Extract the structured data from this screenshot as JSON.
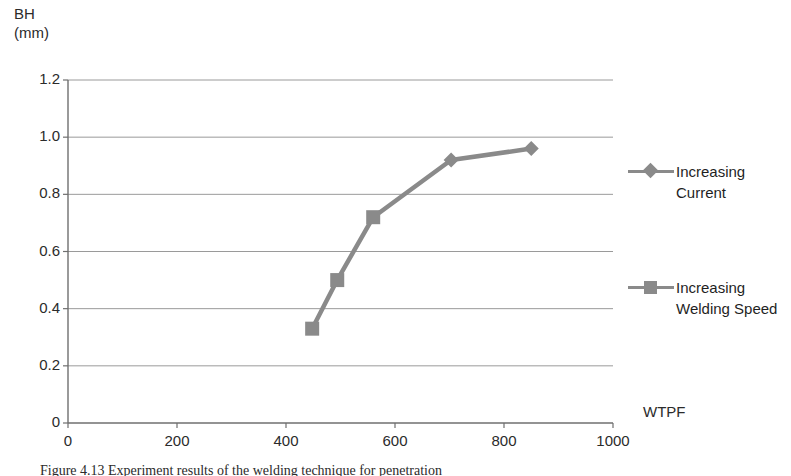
{
  "figure": {
    "caption": "Figure 4.13 Experiment results of the welding technique for penetration",
    "background": "#ffffff",
    "series_color": "#8a8a8a",
    "grid_color": "#9a9a9a",
    "axis_color": "#6f6f6f"
  },
  "chart_data": {
    "type": "line",
    "title": "",
    "subtitle": "",
    "xlabel": "WTPF",
    "ylabel": "BH (mm)",
    "ylabel_lines": [
      "BH",
      "(mm)"
    ],
    "xlim": [
      0,
      1000
    ],
    "ylim": [
      0,
      1.2
    ],
    "xticks": [
      0,
      200,
      400,
      600,
      800,
      1000
    ],
    "xtick_labels": [
      "0",
      "200",
      "400",
      "600",
      "800",
      "1000"
    ],
    "yticks": [
      0,
      0.2,
      0.4,
      0.6,
      0.8,
      1.0,
      1.2
    ],
    "ytick_labels": [
      "0",
      "0.2",
      "0.4",
      "0.6",
      "0.8",
      "1.0",
      "1.2"
    ],
    "grid": "horizontal",
    "legend_position": "right",
    "series": [
      {
        "name": "Increasing Welding Speed",
        "marker": "square",
        "color": "#8a8a8a",
        "points": [
          {
            "x": 448,
            "y": 0.33
          },
          {
            "x": 494,
            "y": 0.5
          },
          {
            "x": 560,
            "y": 0.72
          }
        ]
      },
      {
        "name": "Increasing Current",
        "marker": "diamond",
        "color": "#8a8a8a",
        "points": [
          {
            "x": 703,
            "y": 0.92
          },
          {
            "x": 850,
            "y": 0.96
          }
        ]
      }
    ],
    "connected_path": [
      {
        "x": 448,
        "y": 0.33
      },
      {
        "x": 494,
        "y": 0.5
      },
      {
        "x": 560,
        "y": 0.72
      },
      {
        "x": 703,
        "y": 0.92
      },
      {
        "x": 850,
        "y": 0.96
      }
    ]
  },
  "legend": {
    "entries": [
      {
        "label": "Increasing Current",
        "marker": "diamond"
      },
      {
        "label": "Increasing Welding Speed",
        "marker": "square"
      }
    ]
  }
}
